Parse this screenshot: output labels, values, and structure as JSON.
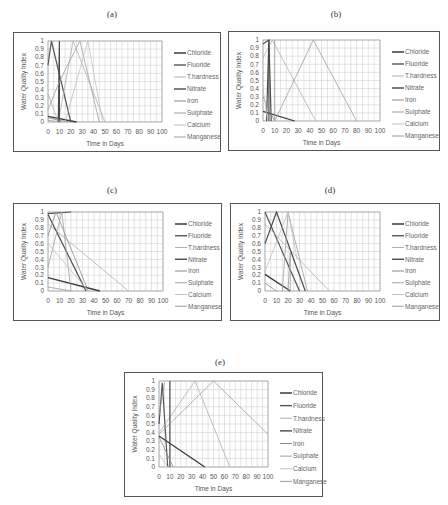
{
  "chart_data": [
    {
      "panel": "(a)",
      "type": "line",
      "xlabel": "Time in Days",
      "ylabel": "Water Quality Index",
      "xlim": [
        0,
        100
      ],
      "ylim": [
        0,
        1
      ],
      "xticks": [
        "0",
        "10",
        "20",
        "30",
        "40",
        "50",
        "60",
        "70",
        "80",
        "90",
        "100"
      ],
      "yticks": [
        "0",
        "0.1",
        "0.2",
        "0.3",
        "0.4",
        "0.5",
        "0.6",
        "0.7",
        "0.8",
        "0.9",
        "1"
      ],
      "grid": true,
      "legend_position": "right",
      "series": [
        {
          "name": "Chloride",
          "points": [
            [
              0,
              0.07
            ],
            [
              25,
              0
            ]
          ]
        },
        {
          "name": "Fluoride",
          "points": [
            [
              0,
              0.7
            ],
            [
              3,
              1
            ],
            [
              20,
              0
            ]
          ]
        },
        {
          "name": "T.hardness",
          "points": [
            [
              0,
              0.35
            ],
            [
              9,
              0
            ],
            [
              22,
              1
            ],
            [
              50,
              0
            ]
          ]
        },
        {
          "name": "Nitrate",
          "points": [
            [
              9,
              0
            ],
            [
              10,
              1
            ],
            [
              10,
              0
            ]
          ]
        },
        {
          "name": "Iron",
          "points": [
            [
              0,
              0.05
            ],
            [
              18,
              0
            ]
          ]
        },
        {
          "name": "Sulphate",
          "points": [
            [
              0,
              0.15
            ],
            [
              10,
              0.5
            ],
            [
              28,
              1
            ],
            [
              45,
              0
            ]
          ]
        },
        {
          "name": "Calcium",
          "points": [
            [
              15,
              0
            ],
            [
              35,
              1
            ],
            [
              48,
              0
            ]
          ]
        },
        {
          "name": "Manganese",
          "points": [
            [
              0,
              0.02
            ],
            [
              12,
              0
            ]
          ]
        }
      ]
    },
    {
      "panel": "(b)",
      "type": "line",
      "xlabel": "Time in Days",
      "ylabel": "Water Quality Index",
      "xlim": [
        0,
        100
      ],
      "ylim": [
        0,
        1
      ],
      "xticks": [
        "0",
        "10",
        "20",
        "30",
        "40",
        "50",
        "60",
        "70",
        "80",
        "90",
        "100"
      ],
      "yticks": [
        "0",
        "0.1",
        "0.2",
        "0.3",
        "0.4",
        "0.5",
        "0.6",
        "0.7",
        "0.8",
        "0.9",
        "1"
      ],
      "grid": true,
      "legend_position": "right",
      "series": [
        {
          "name": "Chloride",
          "points": [
            [
              0,
              0.12
            ],
            [
              27,
              0
            ]
          ]
        },
        {
          "name": "Fluoride",
          "points": [
            [
              0,
              0.95
            ],
            [
              5,
              1
            ],
            [
              5,
              0
            ]
          ]
        },
        {
          "name": "T.hardness",
          "points": [
            [
              0,
              0.78
            ],
            [
              8,
              1
            ],
            [
              45,
              0
            ]
          ]
        },
        {
          "name": "Nitrate",
          "points": [
            [
              3,
              0
            ],
            [
              5,
              1
            ],
            [
              7,
              0
            ]
          ]
        },
        {
          "name": "Iron",
          "points": [
            [
              0,
              0.3
            ],
            [
              10,
              0
            ]
          ]
        },
        {
          "name": "Sulphate",
          "points": [
            [
              10,
              0
            ],
            [
              43,
              1
            ],
            [
              80,
              0
            ]
          ]
        },
        {
          "name": "Calcium",
          "points": [
            [
              0,
              0.4
            ],
            [
              4,
              0
            ]
          ]
        },
        {
          "name": "Manganese",
          "points": [
            [
              10,
              0
            ],
            [
              10,
              1
            ]
          ]
        }
      ]
    },
    {
      "panel": "(c)",
      "type": "line",
      "xlabel": "Time in Days",
      "ylabel": "Water Quality Index",
      "xlim": [
        0,
        100
      ],
      "ylim": [
        0,
        1
      ],
      "xticks": [
        "0",
        "10",
        "20",
        "30",
        "40",
        "50",
        "60",
        "70",
        "80",
        "90",
        "100"
      ],
      "yticks": [
        "0",
        "0.1",
        "0.2",
        "0.3",
        "0.4",
        "0.5",
        "0.6",
        "0.7",
        "0.8",
        "0.9",
        "1"
      ],
      "grid": true,
      "legend_position": "right",
      "series": [
        {
          "name": "Chloride",
          "points": [
            [
              0,
              0.17
            ],
            [
              45,
              0
            ]
          ]
        },
        {
          "name": "Fluoride",
          "points": [
            [
              0,
              0.98
            ],
            [
              20,
              1
            ]
          ]
        },
        {
          "name": "T.hardness",
          "points": [
            [
              0,
              0.85
            ],
            [
              70,
              0
            ]
          ]
        },
        {
          "name": "Nitrate",
          "points": [
            [
              0,
              0.97
            ],
            [
              33,
              0
            ]
          ]
        },
        {
          "name": "Iron",
          "points": [
            [
              0,
              0.7
            ],
            [
              7,
              1
            ],
            [
              35,
              0
            ]
          ]
        },
        {
          "name": "Sulphate",
          "points": [
            [
              0,
              0.3
            ],
            [
              12,
              1
            ],
            [
              20,
              0
            ]
          ]
        },
        {
          "name": "Calcium",
          "points": [
            [
              0,
              0.6
            ],
            [
              35,
              0
            ]
          ]
        },
        {
          "name": "Manganese",
          "points": [
            [
              0,
              0.05
            ],
            [
              20,
              0
            ]
          ]
        }
      ]
    },
    {
      "panel": "(d)",
      "type": "line",
      "xlabel": "Time in Days",
      "ylabel": "Water Quality Index",
      "xlim": [
        0,
        100
      ],
      "ylim": [
        0,
        1
      ],
      "xticks": [
        "0",
        "10",
        "20",
        "30",
        "40",
        "50",
        "60",
        "70",
        "80",
        "90",
        "100"
      ],
      "yticks": [
        "0",
        "0.1",
        "0.2",
        "0.3",
        "0.4",
        "0.5",
        "0.6",
        "0.7",
        "0.8",
        "0.9",
        "1"
      ],
      "grid": true,
      "legend_position": "right",
      "series": [
        {
          "name": "Chloride",
          "points": [
            [
              0,
              0.21
            ],
            [
              22,
              0
            ]
          ]
        },
        {
          "name": "Fluoride",
          "points": [
            [
              0,
              1
            ],
            [
              30,
              0
            ]
          ]
        },
        {
          "name": "T.hardness",
          "points": [
            [
              0,
              0.85
            ],
            [
              56,
              0
            ]
          ]
        },
        {
          "name": "Nitrate",
          "points": [
            [
              0,
              0.6
            ],
            [
              10,
              1
            ],
            [
              35,
              0
            ]
          ]
        },
        {
          "name": "Iron",
          "points": [
            [
              0,
              0.1
            ],
            [
              10,
              0
            ]
          ]
        },
        {
          "name": "Sulphate",
          "points": [
            [
              15,
              0
            ],
            [
              20,
              1
            ],
            [
              37,
              0
            ]
          ]
        },
        {
          "name": "Calcium",
          "points": [
            [
              0,
              0.25
            ],
            [
              20,
              1
            ],
            [
              28,
              0.4
            ]
          ]
        },
        {
          "name": "Manganese",
          "points": [
            [
              20,
              0
            ],
            [
              22,
              0.5
            ],
            [
              22,
              0
            ]
          ]
        }
      ]
    },
    {
      "panel": "(e)",
      "type": "line",
      "xlabel": "Time in Days",
      "ylabel": "Water Quality Index",
      "xlim": [
        0,
        100
      ],
      "ylim": [
        0,
        1
      ],
      "xticks": [
        "0",
        "10",
        "20",
        "30",
        "40",
        "50",
        "60",
        "70",
        "80",
        "90",
        "100"
      ],
      "yticks": [
        "0",
        "0.1",
        "0.2",
        "0.3",
        "0.4",
        "0.5",
        "0.6",
        "0.7",
        "0.8",
        "0.9",
        "1"
      ],
      "grid": true,
      "legend_position": "right",
      "series": [
        {
          "name": "Chloride",
          "points": [
            [
              0,
              0.36
            ],
            [
              42,
              0
            ]
          ]
        },
        {
          "name": "Fluoride",
          "points": [
            [
              0,
              0.5
            ],
            [
              3,
              0.98
            ],
            [
              8,
              0
            ]
          ]
        },
        {
          "name": "T.hardness",
          "points": [
            [
              0,
              0.4
            ],
            [
              33,
              1
            ],
            [
              65,
              0
            ]
          ]
        },
        {
          "name": "Nitrate",
          "points": [
            [
              10,
              0
            ],
            [
              10,
              1
            ]
          ]
        },
        {
          "name": "Iron",
          "points": [
            [
              0,
              0.35
            ],
            [
              13,
              0
            ]
          ]
        },
        {
          "name": "Sulphate",
          "points": [
            [
              0,
              0.38
            ],
            [
              50,
              1
            ],
            [
              100,
              0.38
            ]
          ]
        },
        {
          "name": "Calcium",
          "points": [
            [
              0,
              0.15
            ],
            [
              8,
              0
            ]
          ]
        },
        {
          "name": "Manganese",
          "points": [
            [
              0,
              0.6
            ],
            [
              5,
              0.98
            ]
          ]
        }
      ]
    }
  ],
  "legend": [
    "Chloride",
    "Fluoride",
    "T.hardness",
    "Nitrate",
    "Iron",
    "Sulphate",
    "Calcium",
    "Manganese"
  ],
  "series_colors": [
    "#3a3a3a",
    "#555555",
    "#b0b0b0",
    "#4a4a4a",
    "#8a8a8a",
    "#a0a0a0",
    "#c0c0c0",
    "#9a9a9a"
  ],
  "series_widths": [
    1.3,
    1.2,
    0.8,
    1.2,
    0.8,
    0.8,
    0.8,
    0.8
  ],
  "panels": {
    "a": {
      "label": "(a)"
    },
    "b": {
      "label": "(b)"
    },
    "c": {
      "label": "(c)"
    },
    "d": {
      "label": "(d)"
    },
    "e": {
      "label": "(e)"
    }
  }
}
